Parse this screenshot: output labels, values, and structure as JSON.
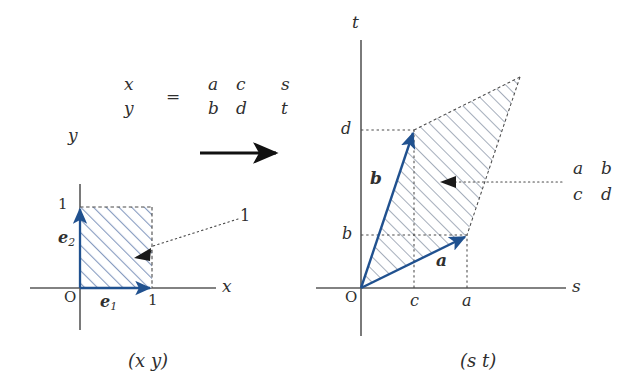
{
  "figure": {
    "title_caption_left": "(x  y)",
    "title_caption_right": "(s  t)"
  },
  "equation": {
    "lhs": {
      "row1": "x",
      "row2": "y"
    },
    "equals": "=",
    "matrix": {
      "r1c1": "a",
      "r1c2": "c",
      "r2c1": "b",
      "r2c2": "d"
    },
    "rhs": {
      "row1": "s",
      "row2": "t"
    }
  },
  "transform_arrow": {
    "name": "transformation-arrow"
  },
  "left_plane": {
    "axis_x_label": "x",
    "axis_y_label": "y",
    "origin_label": "O",
    "tick_x": "1",
    "tick_y": "1",
    "vector_e1": "e",
    "vector_e1_sub": "1",
    "vector_e2": "e",
    "vector_e2_sub": "2",
    "area_label": "1"
  },
  "right_plane": {
    "axis_s_label": "s",
    "axis_t_label": "t",
    "origin_label": "O",
    "tick_s_c": "c",
    "tick_s_a": "a",
    "tick_t_b": "b",
    "tick_t_d": "d",
    "vector_a": "a",
    "vector_b": "b",
    "area_label": {
      "r1c1": "a",
      "r1c2": "b",
      "r2c1": "c",
      "r2c2": "d"
    }
  },
  "colors": {
    "vector_blue": "#20518f",
    "hatch_blue": "#7d93b8",
    "hatch_gray": "#8c97a8",
    "axis_gray": "#595959",
    "ink": "#2f2f2f"
  }
}
